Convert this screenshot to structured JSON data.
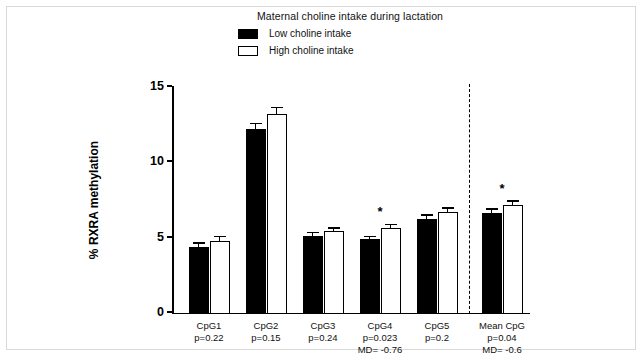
{
  "chart_data": {
    "type": "bar",
    "title": "Maternal choline intake during lactation",
    "xlabel": "",
    "ylabel": "% RXRA methylation",
    "ylim": [
      0,
      15
    ],
    "yticks": [
      0,
      5,
      10,
      15
    ],
    "ytick_labels": [
      "0",
      "5",
      "10",
      "15"
    ],
    "grid": false,
    "legend_position": "top-center",
    "categories": [
      "CpG1",
      "CpG2",
      "CpG3",
      "CpG4",
      "CpG5",
      "Mean CpG"
    ],
    "series": [
      {
        "name": "Low choline intake",
        "color": "#000000",
        "values": [
          4.45,
          12.3,
          5.2,
          4.95,
          6.3,
          6.7
        ],
        "errors": [
          0.2,
          0.3,
          0.15,
          0.15,
          0.2,
          0.2
        ]
      },
      {
        "name": "High choline intake",
        "color": "#ffffff",
        "values": [
          4.85,
          13.3,
          5.5,
          5.7,
          6.8,
          7.25
        ],
        "errors": [
          0.25,
          0.35,
          0.15,
          0.2,
          0.2,
          0.2
        ]
      }
    ],
    "group_annotations": [
      {
        "category": "CpG1",
        "p": "p=0.22",
        "md": "",
        "significant": false
      },
      {
        "category": "CpG2",
        "p": "p=0.15",
        "md": "",
        "significant": false
      },
      {
        "category": "CpG3",
        "p": "p=0.24",
        "md": "",
        "significant": false
      },
      {
        "category": "CpG4",
        "p": "p=0.023",
        "md": "MD= -0.76",
        "significant": true
      },
      {
        "category": "CpG5",
        "p": "p=0.2",
        "md": "",
        "significant": false
      },
      {
        "category": "Mean CpG",
        "p": "p=0.04",
        "md": "MD= -0.6",
        "significant": true
      }
    ],
    "significance_marker": "*",
    "separator_before_category": "Mean CpG"
  },
  "legend": {
    "title": "Maternal choline intake during lactation",
    "items": [
      {
        "label": "Low choline intake",
        "swatch": "filled-black"
      },
      {
        "label": "High choline intake",
        "swatch": "outlined-white"
      }
    ]
  },
  "axis": {
    "y_label": "% RXRA methylation",
    "y_ticks": [
      "15",
      "10",
      "5",
      "0"
    ]
  },
  "x_labels": [
    {
      "name": "CpG1",
      "p": "p=0.22",
      "md": ""
    },
    {
      "name": "CpG2",
      "p": "p=0.15",
      "md": ""
    },
    {
      "name": "CpG3",
      "p": "p=0.24",
      "md": ""
    },
    {
      "name": "CpG4",
      "p": "p=0.023",
      "md": "MD= -0.76"
    },
    {
      "name": "CpG5",
      "p": "p=0.2",
      "md": ""
    },
    {
      "name": "Mean CpG",
      "p": "p=0.04",
      "md": "MD= -0.6"
    }
  ]
}
